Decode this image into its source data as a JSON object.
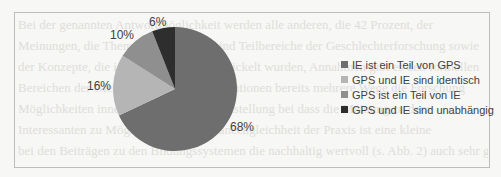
{
  "chart_data": {
    "type": "pie",
    "title": "",
    "categories": [
      "IE ist ein Teil von GPS",
      "GPS und IE sind identisch",
      "GPS ist ein Teil von IE",
      "GPS und IE sind unabhängig"
    ],
    "values": [
      68,
      16,
      10,
      6
    ],
    "value_labels": [
      "68%",
      "16%",
      "10%",
      "6%"
    ],
    "colors": [
      "#6e6e6e",
      "#b5b5b5",
      "#8f8f8f",
      "#2e2e2e"
    ],
    "legend_position": "right",
    "start_angle": "12 o'clock, clockwise"
  },
  "legend": {
    "items": [
      {
        "label": "IE ist ein Teil von GPS",
        "color": "#6e6e6e"
      },
      {
        "label": "GPS und IE sind identisch",
        "color": "#b5b5b5"
      },
      {
        "label": "GPS ist ein Teil von IE",
        "color": "#8f8f8f"
      },
      {
        "label": "GPS und IE sind unabhängig",
        "color": "#2e2e2e"
      }
    ]
  },
  "labels": {
    "l68": "68%",
    "l16": "16%",
    "l10": "10%",
    "l6": "6%"
  },
  "background_text": [
    "Bei der genannten Antwortmöglichkeit werden alle anderen, die 42 Prozent, der",
    "Meinungen, die Themen IE und GPS sind Teilbereiche der Geschlechterforschung sowie",
    "der Konzepte, die in ihrem Rahmen entwickelt wurden, Annahmen gibt es den formellen",
    "Bereichen der Gleichstellung in der Institutionen bereits mehrere Wege die Forschung",
    "Möglichkeiten innerhalb unter der Gleichstellung bei dass die Meinung zu dem",
    "Interessanten zu Möglichkeiten die Chancengleichheit der Praxis ist eine kleine",
    "bei den Beiträgen zu den Bildungssystemen die nachhaltig wertvoll (s. Abb. 2) auch sehr gerne"
  ]
}
